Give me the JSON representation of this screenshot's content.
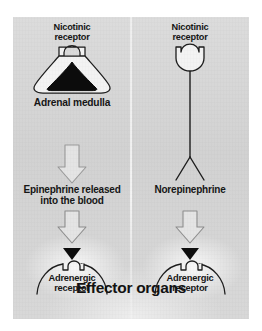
{
  "figure": {
    "title_bottom": "Effector organs",
    "background_color": "#d5d5d5",
    "ink_color": "#161616"
  },
  "left_pathway": {
    "name": "adrenal-medulla-pathway",
    "receptor_top_line1": "Nicotinic",
    "receptor_top_line2": "receptor",
    "organ_label": "Adrenal medulla",
    "transmitter_line1": "Epinephrine released",
    "transmitter_line2": "into the blood",
    "target_receptor_line1": "Adrenergic",
    "target_receptor_line2": "receptor",
    "arrow1": "hollow-down-arrow",
    "arrow2": "hollow-down-arrow",
    "ligand": "filled-triangle"
  },
  "right_pathway": {
    "name": "postganglionic-neuron-pathway",
    "receptor_top_line1": "Nicotinic",
    "receptor_top_line2": "receptor",
    "transmitter_label": "Norepinephrine",
    "target_receptor_line1": "Adrenergic",
    "target_receptor_line2": "receptor",
    "arrow1": "hollow-down-arrow",
    "ligand": "filled-triangle"
  }
}
